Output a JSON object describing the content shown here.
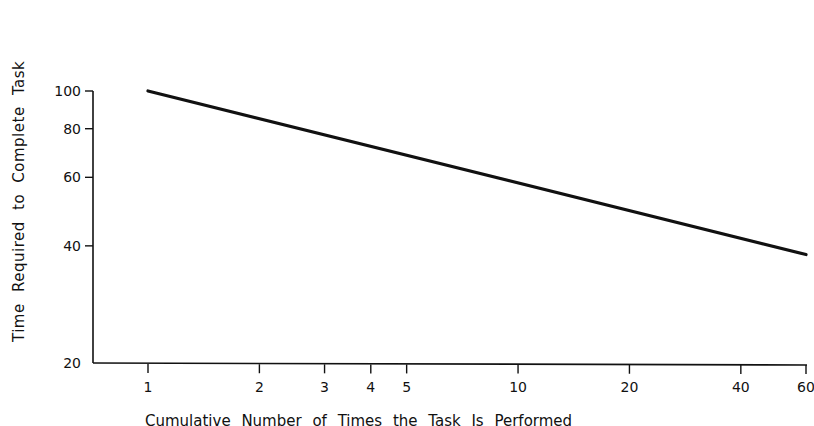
{
  "chart_data": {
    "type": "line",
    "title": "",
    "xlabel": "Cumulative Number of Times the Task Is Performed",
    "ylabel": "Time Required to Complete Task",
    "x_scale": "log",
    "y_scale": "log",
    "xlim": [
      1,
      60
    ],
    "ylim": [
      20,
      100
    ],
    "x_ticks": [
      1,
      2,
      3,
      4,
      5,
      10,
      20,
      40,
      60
    ],
    "y_ticks": [
      20,
      40,
      60,
      80,
      100
    ],
    "grid": false,
    "legend": null,
    "series": [
      {
        "name": "Learning curve",
        "x": [
          1,
          2,
          3,
          4,
          5,
          10,
          20,
          40,
          60
        ],
        "y": [
          100,
          85,
          77,
          72,
          69,
          58,
          50,
          42,
          38
        ]
      }
    ]
  },
  "labels": {
    "ylabel": "Time Required to Complete Task",
    "xlabel": "Cumulative Number of Times the Task Is Performed"
  }
}
